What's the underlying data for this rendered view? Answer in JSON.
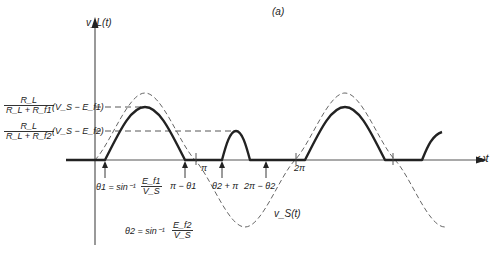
{
  "figure": {
    "panel_label": "(a)",
    "y_axis_label": "v_L(t)",
    "x_axis_label": "ωt",
    "source_label": "v_S(t)"
  },
  "levels": [
    {
      "id": "level-1",
      "num": "R_L",
      "den": "R_L + R_f1",
      "factor": "(V_S − E_f1)"
    },
    {
      "id": "level-2",
      "num": "R_L",
      "den": "R_L + R_f2",
      "factor": "(V_S − E_f2)"
    }
  ],
  "annotations": {
    "theta1_eq": "θ1 = sin⁻¹",
    "theta1_frac_num": "E_f1",
    "theta1_frac_den": "V_S",
    "pi_minus_theta1": "π − θ1",
    "pi": "π",
    "theta2_plus_pi": "θ2 + π",
    "two_pi_minus_theta2": "2π − θ2",
    "two_pi": "2π",
    "theta2_eq": "θ2 = sin⁻¹",
    "theta2_frac_num": "E_f2",
    "theta2_frac_den": "V_S"
  },
  "colors": {
    "axis": "#444444",
    "load_curve": "#222222",
    "source_curve": "#555555",
    "background": "#ffffff"
  }
}
